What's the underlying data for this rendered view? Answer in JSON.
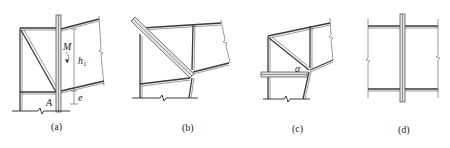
{
  "figure": {
    "panels": [
      {
        "id": "a",
        "caption": "(a)",
        "labels": {
          "moment": "M",
          "height": "h",
          "height_sub": "1",
          "point": "A",
          "eccentricity": "e"
        }
      },
      {
        "id": "b",
        "caption": "(b)"
      },
      {
        "id": "c",
        "caption": "(c)",
        "labels": {
          "angle": "α"
        }
      },
      {
        "id": "d",
        "caption": "(d)"
      }
    ]
  }
}
